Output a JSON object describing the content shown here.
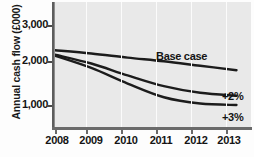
{
  "chart_data": {
    "type": "line",
    "title": "",
    "subtitle": "",
    "xlabel": "",
    "ylabel": "Annual cash flow (£000)",
    "x": [
      2008,
      2009,
      2010,
      2011,
      2012,
      2013
    ],
    "xtick_labels": [
      "2008",
      "2009",
      "2010",
      "2011",
      "2012",
      "2013"
    ],
    "ytick_labels": [
      "1,000",
      "2,000",
      "3,000"
    ],
    "ytick_values": [
      1000,
      2000,
      3000
    ],
    "xlim": [
      2008,
      2013.4
    ],
    "ylim": [
      0,
      3400
    ],
    "grid": "vertical-white",
    "legend_position": "inline-right",
    "series": [
      {
        "name": "Base case",
        "values": [
          2100,
          2010,
          1900,
          1800,
          1680,
          1560
        ],
        "color": "#1c1c1c",
        "label": "Base case"
      },
      {
        "name": "+2%",
        "values": [
          1980,
          1740,
          1420,
          1130,
          950,
          870
        ],
        "color": "#1c1c1c",
        "label": "+2%"
      },
      {
        "name": "+3%",
        "values": [
          1950,
          1620,
          1200,
          830,
          660,
          620
        ],
        "color": "#1c1c1c",
        "label": "+3%"
      }
    ],
    "annotations": [
      {
        "text": "Base case",
        "x": 2011.1,
        "y": 2050
      },
      {
        "text": "+2%",
        "x": 2013.45,
        "y": 930
      },
      {
        "text": "+3%",
        "x": 2013.45,
        "y": 640
      }
    ],
    "colors": {
      "plot_background": "#e9e9e9",
      "page_background": "#fdfdfd",
      "gridline": "#fbfbfb",
      "axis": "#5d5d5d",
      "line": "#1c1c1c",
      "text": "#141414"
    }
  }
}
